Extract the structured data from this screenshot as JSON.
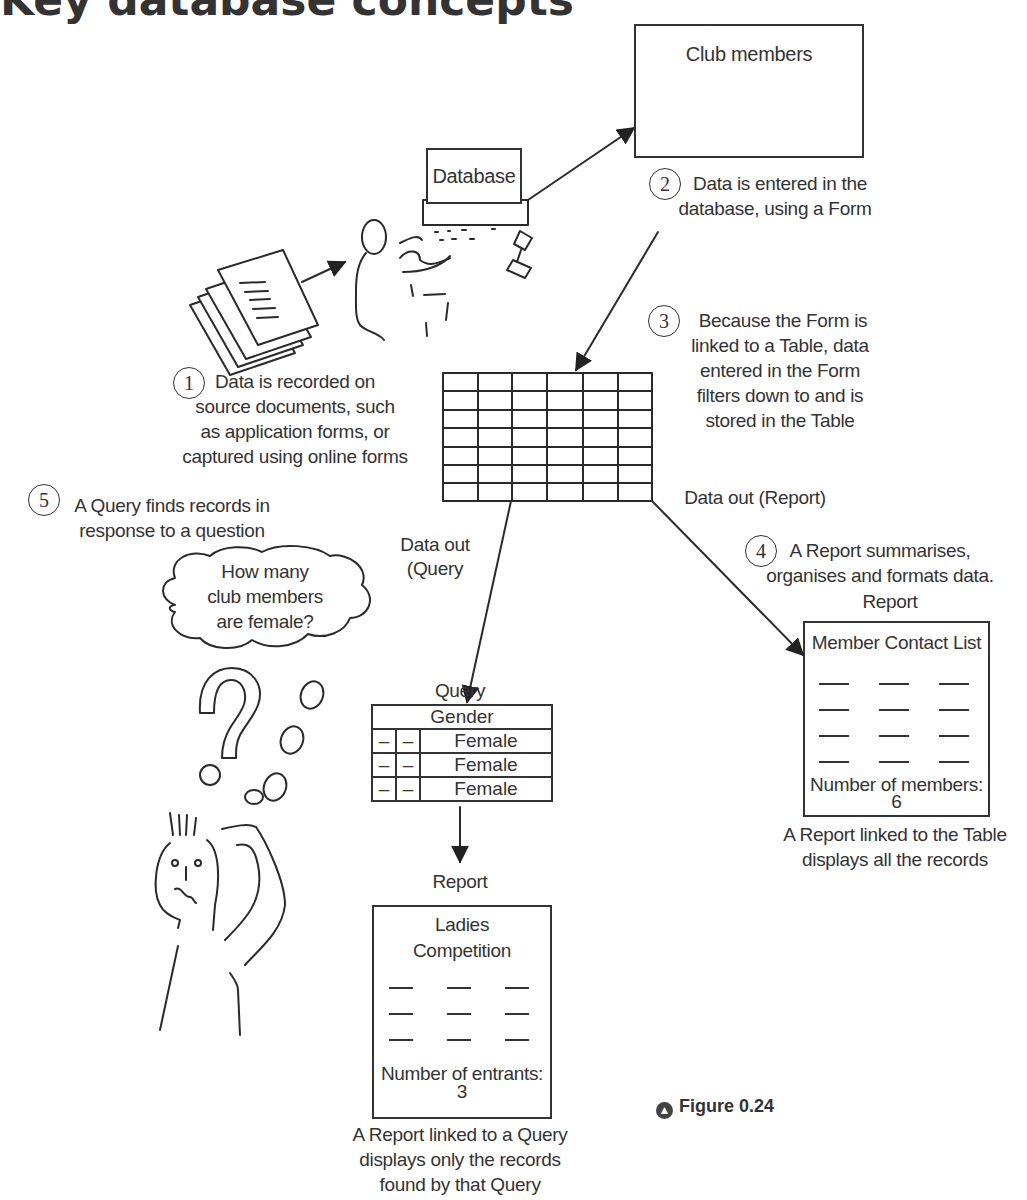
{
  "heading_partial": "Key database concepts",
  "club_members": {
    "title": "Club members",
    "fields_left": 3,
    "fields_right": 2
  },
  "database_screen": {
    "label": "Database"
  },
  "steps": [
    {
      "number": "1",
      "text": [
        "Data is recorded on",
        "source documents, such",
        "as application forms, or",
        "captured using online forms"
      ]
    },
    {
      "number": "2",
      "text": [
        "Data is entered in the",
        "database, using a Form"
      ]
    },
    {
      "number": "3",
      "text": [
        "Because the Form is",
        "linked to a Table, data",
        "entered in the Form",
        "filters down to and is",
        "stored in the Table"
      ]
    },
    {
      "number": "4",
      "text": [
        "A Report summarises,",
        "organises and formats data."
      ]
    },
    {
      "number": "5",
      "text": [
        "A Query finds records in",
        "response to a question"
      ]
    }
  ],
  "table_grid": {
    "columns": 6,
    "rows": 7
  },
  "labels": {
    "data_out_report": "Data out (Report)",
    "data_out_query_line1": "Data out",
    "data_out_query_line2": "(Query"
  },
  "thought_bubble": [
    "How many",
    "club members",
    "are female?"
  ],
  "query": {
    "title": "Query",
    "header": "Gender",
    "rows": [
      {
        "c1": "–",
        "c2": "–",
        "gender": "Female"
      },
      {
        "c1": "–",
        "c2": "–",
        "gender": "Female"
      },
      {
        "c1": "–",
        "c2": "–",
        "gender": "Female"
      }
    ]
  },
  "query_report": {
    "label": "Report",
    "title_line1": "Ladies",
    "title_line2": "Competition",
    "dash_rows": 3,
    "count_label": "Number of entrants:",
    "count_value": "3",
    "caption": [
      "A Report linked to a Query",
      "displays only the records",
      "found by that Query"
    ]
  },
  "table_report": {
    "label": "Report",
    "title": "Member Contact List",
    "dash_rows": 4,
    "count_label": "Number of members:",
    "count_value": "6",
    "caption": [
      "A Report linked to the Table",
      "displays all the records"
    ]
  },
  "figure": {
    "icon": "▲",
    "label": "Figure 0.24"
  }
}
